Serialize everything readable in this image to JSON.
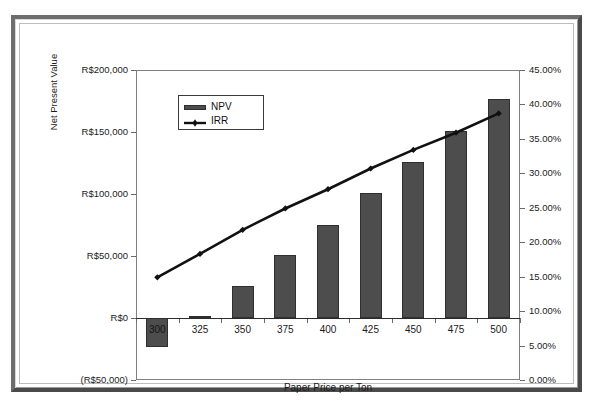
{
  "chart_data": {
    "type": "bar",
    "title": "",
    "xlabel": "Paper Price per Ton",
    "ylabel": "Net Present Value",
    "y2label": "",
    "categories": [
      "300",
      "325",
      "350",
      "375",
      "400",
      "425",
      "450",
      "475",
      "500"
    ],
    "grid": false,
    "legend_position": "top-left",
    "ylim": [
      -50000,
      200000
    ],
    "y2lim": [
      0,
      45
    ],
    "yticks": [
      "(R$50,000)",
      "R$0",
      "R$50,000",
      "R$100,000",
      "R$150,000",
      "R$200,000"
    ],
    "ytick_values": [
      -50000,
      0,
      50000,
      100000,
      150000,
      200000
    ],
    "y2ticks": [
      "0.00%",
      "5.00%",
      "10.00%",
      "15.00%",
      "20.00%",
      "25.00%",
      "30.00%",
      "35.00%",
      "40.00%",
      "45.00%"
    ],
    "y2tick_values": [
      0,
      5,
      10,
      15,
      20,
      25,
      30,
      35,
      40,
      45
    ],
    "series": [
      {
        "name": "NPV",
        "type": "bar",
        "axis": "left",
        "color": "#4d4d4d",
        "values": [
          -23000,
          2000,
          26000,
          50500,
          75000,
          100500,
          125500,
          150500,
          177000
        ]
      },
      {
        "name": "IRR",
        "type": "line",
        "axis": "right",
        "color": "#111111",
        "values": [
          14.9,
          18.3,
          21.8,
          24.9,
          27.7,
          30.7,
          33.4,
          35.9,
          38.7
        ]
      }
    ]
  },
  "legend": {
    "items": [
      {
        "label": "NPV",
        "marker": "bar-swatch"
      },
      {
        "label": "IRR",
        "marker": "line-marker"
      }
    ]
  },
  "colors": {
    "bar": "#4d4d4d",
    "bar_border": "#2f2f2f",
    "line": "#111111",
    "axis": "#6b6b6b",
    "text": "#1b1b1b",
    "frame_light": "#6e6e6e",
    "frame_dark": "#4a4a4a",
    "plot_background": "#ffffff"
  }
}
